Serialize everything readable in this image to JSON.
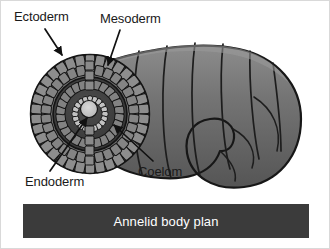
{
  "figure": {
    "title": "Annelid body plan",
    "background_color": "#ffffff"
  },
  "caption": {
    "text": "Annelid body plan",
    "bar_color": "#3b3b3b",
    "text_color": "#ffffff"
  },
  "labels": [
    {
      "id": "ectoderm",
      "text": "Ectoderm",
      "points_to": "outer-cell-ring"
    },
    {
      "id": "mesoderm",
      "text": "Mesoderm",
      "points_to": "middle-cell-ring"
    },
    {
      "id": "endoderm",
      "text": "Endoderm",
      "points_to": "gut-lumen-lining"
    },
    {
      "id": "coelom",
      "text": "Coelom",
      "points_to": "body-cavity"
    }
  ],
  "colors": {
    "worm_body": "#6a6a6a",
    "worm_body_light": "#8a8a8a",
    "worm_body_dark": "#4b4b4b",
    "outline": "#1a1a1a",
    "cell_fill": "#7d7d7d",
    "cell_fill_light": "#9a9a9a",
    "coelom_cavity": "#3f3f3f",
    "gut_lumen": "#c9c9c9",
    "label_text": "#1a1a1a",
    "caption_bar": "#3b3b3b"
  },
  "cross_section": {
    "description": "Annelid cross section showing concentric germ layers",
    "rings": [
      {
        "name": "ectoderm",
        "order": 1,
        "cell_count": 34
      },
      {
        "name": "ectoderm-inner",
        "order": 2,
        "cell_count": 30
      },
      {
        "name": "coelom",
        "order": 3,
        "cell_count": 0
      },
      {
        "name": "mesoderm",
        "order": 4,
        "cell_count": 26
      },
      {
        "name": "endoderm",
        "order": 5,
        "cell_count": 20
      }
    ]
  },
  "worm": {
    "segment_count": 7,
    "shape": "curved-segmented-tube"
  }
}
